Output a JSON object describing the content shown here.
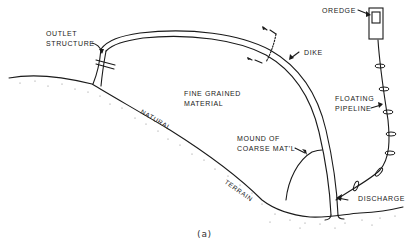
{
  "figure": {
    "caption": "(a)",
    "labels": {
      "outlet_structure_1": "OUTLET",
      "outlet_structure_2": "STRUCTURE",
      "dredge": "OREDGE",
      "dike": "DIKE",
      "fine_grained_1": "FINE GRAINED",
      "fine_grained_2": "MATERIAL",
      "floating_pipeline_1": "FLOATING",
      "floating_pipeline_2": "PIPELINE",
      "natural": "NATURAL",
      "terrain": "TERRAIN",
      "mound_1": "MOUND OF",
      "mound_2": "COARSE MAT'L",
      "discharge": "DISCHARGE"
    },
    "colors": {
      "ink": "#1a1a1a",
      "background": "#ffffff",
      "stipple": "#888888"
    }
  }
}
